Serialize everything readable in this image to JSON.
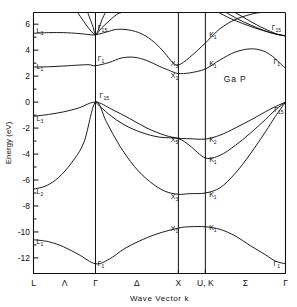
{
  "chart_data": {
    "type": "line",
    "title": "",
    "material_label": "Ga P",
    "xlabel": "Wave  Vector  k",
    "ylabel": "Energy (eV)",
    "ylim": [
      -13.2,
      6.9
    ],
    "ytick_values": [
      6,
      4,
      2,
      0,
      -2,
      -4,
      -6,
      -8,
      -10,
      -12
    ],
    "ytick_labels": [
      "6",
      "4",
      "2",
      "0",
      "-2",
      "-4",
      "-6",
      "-8",
      "-10",
      "-12"
    ],
    "minor_ytick_values": [
      5,
      3,
      1,
      -1,
      -3,
      -5,
      -7,
      -9,
      -11
    ],
    "grid": false,
    "legend": "none",
    "xtick_labels": [
      "L",
      "Λ",
      "Γ",
      "Δ",
      "X",
      "U, K",
      "Σ",
      "Γ"
    ],
    "symmetry_points": [
      {
        "label": "L",
        "x_frac": 0.0
      },
      {
        "label": "Γ",
        "x_frac": 0.246
      },
      {
        "label": "X",
        "x_frac": 0.575
      },
      {
        "label": "U, K",
        "x_frac": 0.682
      },
      {
        "label": "Γ",
        "x_frac": 1.0
      }
    ],
    "segment_labels": [
      {
        "label": "Λ",
        "x_frac": 0.123
      },
      {
        "label": "Δ",
        "x_frac": 0.41
      },
      {
        "label": "Σ",
        "x_frac": 0.841
      }
    ],
    "vertical_lines_x_frac": [
      0.0,
      0.246,
      0.575,
      0.682,
      1.0
    ],
    "band_point_labels": [
      {
        "text": "L",
        "sub": "3",
        "x_frac": 0.012,
        "energy": 5.3
      },
      {
        "text": "L",
        "sub": "1",
        "x_frac": 0.012,
        "energy": 2.55
      },
      {
        "text": "L",
        "sub": "3",
        "x_frac": 0.012,
        "energy": -1.45
      },
      {
        "text": "L",
        "sub": "2",
        "x_frac": 0.012,
        "energy": -7.05
      },
      {
        "text": "L",
        "sub": "1",
        "x_frac": 0.012,
        "energy": -10.95
      },
      {
        "text": "Γ",
        "sub": "15",
        "x_frac": 0.255,
        "energy": 5.55
      },
      {
        "text": "Γ",
        "sub": "1",
        "x_frac": 0.255,
        "energy": 3.15
      },
      {
        "text": "Γ",
        "sub": "15",
        "x_frac": 0.262,
        "energy": 0.32
      },
      {
        "text": "Γ",
        "sub": "1",
        "x_frac": 0.255,
        "energy": -12.65
      },
      {
        "text": "X",
        "sub": "3",
        "x_frac": 0.545,
        "energy": 2.75
      },
      {
        "text": "X",
        "sub": "1",
        "x_frac": 0.545,
        "energy": 1.85
      },
      {
        "text": "X",
        "sub": "5",
        "x_frac": 0.545,
        "energy": -3.1
      },
      {
        "text": "X",
        "sub": "3",
        "x_frac": 0.545,
        "energy": -7.45
      },
      {
        "text": "X",
        "sub": "1",
        "x_frac": 0.545,
        "energy": -9.95
      },
      {
        "text": "K",
        "sub": "1",
        "x_frac": 0.697,
        "energy": 5.05
      },
      {
        "text": "K",
        "sub": "1",
        "x_frac": 0.697,
        "energy": 2.8
      },
      {
        "text": "K",
        "sub": "2",
        "x_frac": 0.697,
        "energy": -3.05
      },
      {
        "text": "K",
        "sub": "1",
        "x_frac": 0.697,
        "energy": -4.65
      },
      {
        "text": "K",
        "sub": "1",
        "x_frac": 0.697,
        "energy": -7.3
      },
      {
        "text": "K",
        "sub": "1",
        "x_frac": 0.697,
        "energy": -9.85
      },
      {
        "text": "Γ",
        "sub": "15",
        "x_frac": 0.945,
        "energy": 5.55
      },
      {
        "text": "Γ",
        "sub": "1",
        "x_frac": 0.952,
        "energy": 2.95
      },
      {
        "text": "Γ",
        "sub": "15",
        "x_frac": 0.955,
        "energy": -0.75
      },
      {
        "text": "Γ",
        "sub": "1",
        "x_frac": 0.952,
        "energy": -12.6
      }
    ],
    "bands": [
      {
        "name": "valence-1-heavy",
        "points": [
          [
            0.0,
            -10.6
          ],
          [
            0.06,
            -10.75
          ],
          [
            0.12,
            -11.15
          ],
          [
            0.18,
            -11.75
          ],
          [
            0.246,
            -12.45
          ],
          [
            0.3,
            -12.1
          ],
          [
            0.36,
            -11.3
          ],
          [
            0.42,
            -10.7
          ],
          [
            0.49,
            -10.15
          ],
          [
            0.575,
            -9.7
          ],
          [
            0.62,
            -9.6
          ],
          [
            0.682,
            -9.6
          ],
          [
            0.74,
            -9.8
          ],
          [
            0.8,
            -10.3
          ],
          [
            0.86,
            -11.05
          ],
          [
            0.92,
            -11.75
          ],
          [
            0.96,
            -12.25
          ],
          [
            1.0,
            -12.45
          ]
        ]
      },
      {
        "name": "valence-2",
        "points": [
          [
            0.0,
            -6.7
          ],
          [
            0.05,
            -6.45
          ],
          [
            0.1,
            -5.8
          ],
          [
            0.15,
            -4.7
          ],
          [
            0.2,
            -3.1
          ],
          [
            0.246,
            0.0
          ],
          [
            0.29,
            -1.55
          ],
          [
            0.34,
            -3.3
          ],
          [
            0.4,
            -4.95
          ],
          [
            0.46,
            -6.1
          ],
          [
            0.52,
            -6.85
          ],
          [
            0.575,
            -7.1
          ],
          [
            0.62,
            -7.05
          ],
          [
            0.682,
            -7.0
          ],
          [
            0.74,
            -6.6
          ],
          [
            0.8,
            -5.5
          ],
          [
            0.86,
            -4.0
          ],
          [
            0.92,
            -2.3
          ],
          [
            0.96,
            -1.1
          ],
          [
            1.0,
            0.0
          ]
        ]
      },
      {
        "name": "valence-3",
        "points": [
          [
            0.246,
            0.0
          ],
          [
            0.3,
            -0.95
          ],
          [
            0.36,
            -1.75
          ],
          [
            0.43,
            -2.35
          ],
          [
            0.5,
            -2.7
          ],
          [
            0.575,
            -2.82
          ],
          [
            0.62,
            -3.35
          ],
          [
            0.682,
            -4.3
          ],
          [
            0.74,
            -4.1
          ],
          [
            0.8,
            -3.35
          ],
          [
            0.86,
            -2.4
          ],
          [
            0.92,
            -1.35
          ],
          [
            0.96,
            -0.6
          ],
          [
            1.0,
            0.0
          ]
        ]
      },
      {
        "name": "valence-4-light",
        "points": [
          [
            0.0,
            -1.1
          ],
          [
            0.06,
            -0.95
          ],
          [
            0.12,
            -0.75
          ],
          [
            0.18,
            -0.45
          ],
          [
            0.246,
            0.0
          ],
          [
            0.31,
            -0.55
          ],
          [
            0.38,
            -1.25
          ],
          [
            0.45,
            -2.0
          ],
          [
            0.52,
            -2.55
          ],
          [
            0.575,
            -2.78
          ],
          [
            0.62,
            -2.82
          ],
          [
            0.682,
            -2.85
          ],
          [
            0.74,
            -2.55
          ],
          [
            0.8,
            -2.0
          ],
          [
            0.86,
            -1.4
          ],
          [
            0.92,
            -0.75
          ],
          [
            0.96,
            -0.35
          ],
          [
            1.0,
            0.0
          ]
        ]
      },
      {
        "name": "conduction-1",
        "points": [
          [
            0.0,
            2.7
          ],
          [
            0.06,
            2.72
          ],
          [
            0.12,
            2.78
          ],
          [
            0.18,
            2.85
          ],
          [
            0.22,
            2.88
          ],
          [
            0.246,
            2.8
          ],
          [
            0.3,
            3.05
          ],
          [
            0.35,
            3.4
          ],
          [
            0.4,
            3.45
          ],
          [
            0.45,
            3.2
          ],
          [
            0.5,
            2.75
          ],
          [
            0.55,
            2.35
          ],
          [
            0.575,
            2.2
          ],
          [
            0.62,
            2.25
          ],
          [
            0.682,
            2.55
          ],
          [
            0.74,
            3.25
          ],
          [
            0.8,
            3.85
          ],
          [
            0.86,
            4.1
          ],
          [
            0.91,
            3.95
          ],
          [
            0.95,
            3.5
          ],
          [
            0.98,
            2.95
          ],
          [
            1.0,
            2.6
          ]
        ]
      },
      {
        "name": "conduction-2",
        "points": [
          [
            0.0,
            5.3
          ],
          [
            0.06,
            5.35
          ],
          [
            0.12,
            5.35
          ],
          [
            0.18,
            5.28
          ],
          [
            0.22,
            5.2
          ],
          [
            0.246,
            5.18
          ],
          [
            0.29,
            5.4
          ],
          [
            0.33,
            5.6
          ],
          [
            0.38,
            5.55
          ],
          [
            0.43,
            5.25
          ],
          [
            0.48,
            4.6
          ],
          [
            0.52,
            3.8
          ],
          [
            0.55,
            3.1
          ],
          [
            0.575,
            2.85
          ],
          [
            0.62,
            3.45
          ],
          [
            0.682,
            4.55
          ],
          [
            0.74,
            5.65
          ],
          [
            0.8,
            6.35
          ],
          [
            0.86,
            6.75
          ],
          [
            0.9,
            6.9
          ]
        ]
      },
      {
        "name": "conduction-3",
        "points": [
          [
            0.175,
            6.9
          ],
          [
            0.2,
            6.2
          ],
          [
            0.225,
            5.55
          ],
          [
            0.246,
            5.2
          ],
          [
            0.27,
            5.7
          ],
          [
            0.3,
            6.25
          ],
          [
            0.33,
            6.75
          ],
          [
            0.35,
            6.9
          ]
        ]
      },
      {
        "name": "conduction-4",
        "points": [
          [
            0.215,
            6.9
          ],
          [
            0.235,
            5.85
          ],
          [
            0.246,
            5.2
          ],
          [
            0.258,
            5.6
          ],
          [
            0.272,
            6.35
          ],
          [
            0.285,
            6.9
          ]
        ]
      },
      {
        "name": "conduction-5-right",
        "points": [
          [
            0.735,
            6.9
          ],
          [
            0.78,
            6.45
          ],
          [
            0.83,
            6.05
          ],
          [
            0.88,
            5.7
          ],
          [
            0.93,
            5.4
          ],
          [
            0.97,
            5.2
          ],
          [
            1.0,
            5.1
          ]
        ]
      },
      {
        "name": "conduction-6-right",
        "points": [
          [
            0.765,
            6.9
          ],
          [
            0.81,
            6.4
          ],
          [
            0.86,
            5.95
          ],
          [
            0.91,
            5.55
          ],
          [
            0.96,
            5.25
          ],
          [
            1.0,
            5.1
          ]
        ]
      },
      {
        "name": "conduction-7-right",
        "points": [
          [
            0.8,
            6.9
          ],
          [
            0.845,
            6.4
          ],
          [
            0.89,
            5.9
          ],
          [
            0.94,
            5.45
          ],
          [
            0.97,
            5.22
          ],
          [
            1.0,
            5.1
          ]
        ]
      }
    ]
  }
}
